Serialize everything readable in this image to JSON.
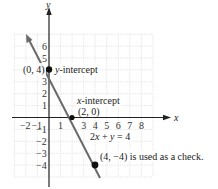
{
  "chart_data": {
    "type": "line",
    "title": "",
    "xlabel": "x",
    "ylabel": "y",
    "xlim": [
      -3,
      9
    ],
    "ylim": [
      -5,
      7
    ],
    "grid": true,
    "x_ticks": [
      "-2",
      "-1",
      "1",
      "3",
      "4",
      "5",
      "6",
      "7",
      "8"
    ],
    "y_ticks": [
      "6",
      "5",
      "3",
      "2",
      "1",
      "-1",
      "-2",
      "-3",
      "-4"
    ],
    "series": [
      {
        "name": "2x + y = 4",
        "equation": "2x + y = 4",
        "x": [
          -2,
          0,
          2,
          4
        ],
        "y": [
          8,
          4,
          0,
          -4
        ]
      }
    ],
    "points": [
      {
        "x": 0,
        "y": 4,
        "label": "(0, 4)",
        "annotation": "y-intercept"
      },
      {
        "x": 2,
        "y": 0,
        "label": "(2, 0)",
        "annotation": "x-intercept"
      },
      {
        "x": 4,
        "y": -4,
        "label": "(4, −4) is used as a check.",
        "annotation": ""
      }
    ],
    "annotations": {
      "y_intercept": "y-intercept",
      "y_intercept_point": "(0, 4)",
      "x_intercept": "x-intercept",
      "x_intercept_point": "(2, 0)",
      "equation": "2x + y = 4",
      "check": "(4, −4) is used as a check."
    }
  },
  "colors": {
    "line": "#6a6a6a",
    "axis": "#222222",
    "grid": "#d4d4d4",
    "point": "#111111"
  }
}
